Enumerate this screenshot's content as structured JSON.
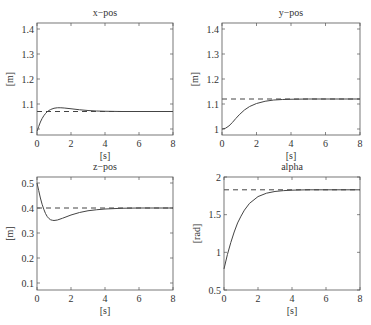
{
  "chart_data": [
    {
      "type": "line",
      "title": "x−pos",
      "xlabel": "[s]",
      "ylabel": "[m]",
      "xlim": [
        0,
        8
      ],
      "ylim": [
        0.976,
        1.424
      ],
      "xticks": [
        0,
        2,
        4,
        6,
        8
      ],
      "yticks": [
        1,
        1.1,
        1.2,
        1.3,
        1.4
      ],
      "ytick_labels": [
        "1",
        "1.1",
        "1.2",
        "1.3",
        "1.4"
      ],
      "grid": false,
      "series": [
        {
          "name": "response",
          "style": "solid",
          "x": [
            0,
            0.1,
            0.2,
            0.3,
            0.4,
            0.5,
            0.6,
            0.7,
            0.8,
            1.0,
            1.2,
            1.4,
            1.6,
            2.0,
            2.5,
            3.0,
            3.5,
            4.0,
            5.0,
            6.0,
            8.0
          ],
          "y": [
            0.99,
            1.01,
            1.028,
            1.042,
            1.053,
            1.062,
            1.069,
            1.074,
            1.078,
            1.083,
            1.085,
            1.085,
            1.084,
            1.081,
            1.077,
            1.074,
            1.072,
            1.071,
            1.07,
            1.07,
            1.07
          ]
        },
        {
          "name": "reference",
          "style": "dashed",
          "x": [
            0,
            8
          ],
          "y": [
            1.07,
            1.07
          ]
        }
      ],
      "frame": {
        "left": 37,
        "right": 173,
        "top": 23,
        "bottom": 135
      }
    },
    {
      "type": "line",
      "title": "y−pos",
      "xlabel": "[s]",
      "ylabel": "[m]",
      "xlim": [
        0,
        8
      ],
      "ylim": [
        0.976,
        1.424
      ],
      "xticks": [
        0,
        2,
        4,
        6,
        8
      ],
      "yticks": [
        1,
        1.1,
        1.2,
        1.3,
        1.4
      ],
      "ytick_labels": [
        "1",
        "1.1",
        "1.2",
        "1.3",
        "1.4"
      ],
      "grid": false,
      "series": [
        {
          "name": "response",
          "style": "solid",
          "x": [
            0,
            0.2,
            0.4,
            0.6,
            0.8,
            1.0,
            1.3,
            1.6,
            2.0,
            2.5,
            3.0,
            3.5,
            4.0,
            5.0,
            6.0,
            8.0
          ],
          "y": [
            1.0,
            1.003,
            1.012,
            1.026,
            1.042,
            1.057,
            1.076,
            1.09,
            1.102,
            1.111,
            1.116,
            1.118,
            1.119,
            1.12,
            1.12,
            1.12
          ]
        },
        {
          "name": "reference",
          "style": "dashed",
          "x": [
            0,
            8
          ],
          "y": [
            1.12,
            1.12
          ]
        }
      ],
      "frame": {
        "left": 222,
        "right": 360,
        "top": 23,
        "bottom": 135
      }
    },
    {
      "type": "line",
      "title": "z−pos",
      "xlabel": "[s]",
      "ylabel": "[m]",
      "xlim": [
        0,
        8
      ],
      "ylim": [
        0.072,
        0.524
      ],
      "xticks": [
        0,
        2,
        4,
        6,
        8
      ],
      "yticks": [
        0.1,
        0.2,
        0.3,
        0.4,
        0.5
      ],
      "ytick_labels": [
        "0.1",
        "0.2",
        "0.3",
        "0.4",
        "0.5"
      ],
      "grid": false,
      "series": [
        {
          "name": "response",
          "style": "solid",
          "x": [
            0,
            0.1,
            0.2,
            0.3,
            0.4,
            0.5,
            0.6,
            0.7,
            0.8,
            0.9,
            1.0,
            1.2,
            1.5,
            2.0,
            2.5,
            3.0,
            3.5,
            4.0,
            5.0,
            6.0,
            8.0
          ],
          "y": [
            0.5,
            0.47,
            0.44,
            0.415,
            0.395,
            0.378,
            0.366,
            0.358,
            0.353,
            0.351,
            0.35,
            0.352,
            0.359,
            0.372,
            0.382,
            0.389,
            0.393,
            0.396,
            0.399,
            0.4,
            0.4
          ]
        },
        {
          "name": "reference",
          "style": "dashed",
          "x": [
            0,
            8
          ],
          "y": [
            0.4,
            0.4
          ]
        }
      ],
      "frame": {
        "left": 37,
        "right": 173,
        "top": 177,
        "bottom": 290
      }
    },
    {
      "type": "line",
      "title": "alpha",
      "xlabel": "[s]",
      "ylabel": "[rad]",
      "xlim": [
        0,
        8
      ],
      "ylim": [
        0.5,
        2
      ],
      "xticks": [
        0,
        2,
        4,
        6,
        8
      ],
      "yticks": [
        0.5,
        1,
        1.5,
        2
      ],
      "ytick_labels": [
        "0.5",
        "1",
        "1.5",
        "2"
      ],
      "grid": false,
      "series": [
        {
          "name": "response",
          "style": "solid",
          "x": [
            0,
            0.2,
            0.4,
            0.6,
            0.8,
            1.0,
            1.2,
            1.5,
            2.0,
            2.5,
            3.0,
            3.5,
            4.0,
            4.5,
            5.0,
            6.0,
            8.0
          ],
          "y": [
            0.78,
            0.97,
            1.13,
            1.27,
            1.39,
            1.48,
            1.56,
            1.65,
            1.74,
            1.785,
            1.808,
            1.819,
            1.825,
            1.828,
            1.83,
            1.83,
            1.83
          ]
        },
        {
          "name": "reference",
          "style": "dashed",
          "x": [
            0,
            8
          ],
          "y": [
            1.83,
            1.83
          ]
        }
      ],
      "frame": {
        "left": 224,
        "right": 360,
        "top": 177,
        "bottom": 290
      }
    }
  ]
}
